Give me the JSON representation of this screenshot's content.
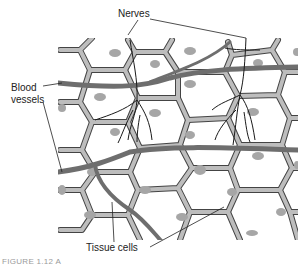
{
  "labels": {
    "nerves": "Nerves",
    "blood_line1": "Blood",
    "blood_line2": "vessels",
    "tissue_cells": "Tissue cells"
  },
  "caption": "FIGURE 1.12   A",
  "colors": {
    "cell_wall": "#b8b8b8",
    "cell_outline": "#444444",
    "nucleus": "#a6a6a6",
    "vessel": "#707070",
    "nerve": "#1a1a1a",
    "background": "#ffffff"
  }
}
